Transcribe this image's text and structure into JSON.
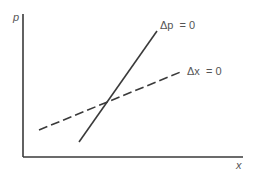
{
  "diagram": {
    "type": "phase-diagram",
    "axes": {
      "y_label": "p",
      "x_label": "x"
    },
    "curves": [
      {
        "name": "delta-p-zero",
        "label": "Δp  = 0",
        "style": "solid",
        "from": [
          79,
          142
        ],
        "to": [
          157,
          31
        ]
      },
      {
        "name": "delta-x-zero",
        "label": "Δx  = 0",
        "style": "dashed",
        "from": [
          39,
          130
        ],
        "to": [
          183,
          71
        ]
      }
    ]
  }
}
